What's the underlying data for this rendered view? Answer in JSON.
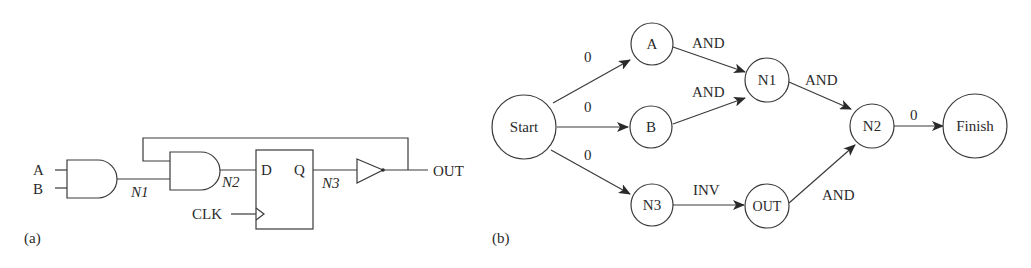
{
  "panel_a": {
    "caption": "(a)",
    "inputs": [
      "A",
      "B"
    ],
    "nets": [
      "N1",
      "N2",
      "N3"
    ],
    "flipflop": {
      "d_label": "D",
      "q_label": "Q",
      "clock_label": "CLK"
    },
    "output_label": "OUT"
  },
  "panel_b": {
    "caption": "(b)",
    "nodes": {
      "start": "Start",
      "a": "A",
      "b": "B",
      "n1": "N1",
      "n2": "N2",
      "n3": "N3",
      "out": "OUT",
      "finish": "Finish"
    },
    "edges": {
      "start_a": "0",
      "start_b": "0",
      "start_n3": "0",
      "a_n1": "AND",
      "b_n1": "AND",
      "n1_n2": "AND",
      "n3_out": "INV",
      "out_n2": "AND",
      "n2_finish": "0"
    }
  }
}
